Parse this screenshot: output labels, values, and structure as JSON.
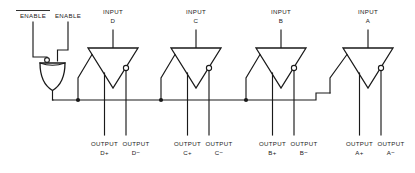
{
  "diagram": {
    "stroke_color": "#1a1a1a",
    "background_color": "#ffffff"
  },
  "enable_section": {
    "inputs": [
      {
        "label": "ENABLE",
        "overbar": true,
        "active": "low"
      },
      {
        "label": "ENABLE",
        "overbar": false,
        "active": "high"
      }
    ],
    "gate": {
      "type": "or-gate",
      "inverted_input": "left",
      "orientation": "down"
    },
    "bus_label": ""
  },
  "buffers": [
    {
      "input_label_line1": "INPUT",
      "input_label_line2": "D",
      "output_plus_line1": "OUTPUT",
      "output_plus_line2": "D+",
      "output_minus_line1": "OUTPUT",
      "output_minus_line2": "D−"
    },
    {
      "input_label_line1": "INPUT",
      "input_label_line2": "C",
      "output_plus_line1": "OUTPUT",
      "output_plus_line2": "C+",
      "output_minus_line1": "OUTPUT",
      "output_minus_line2": "C−"
    },
    {
      "input_label_line1": "INPUT",
      "input_label_line2": "B",
      "output_plus_line1": "OUTPUT",
      "output_plus_line2": "B+",
      "output_minus_line1": "OUTPUT",
      "output_minus_line2": "B−"
    },
    {
      "input_label_line1": "INPUT",
      "input_label_line2": "A",
      "output_plus_line1": "OUTPUT",
      "output_plus_line2": "A+",
      "output_minus_line1": "OUTPUT",
      "output_minus_line2": "A−"
    }
  ]
}
